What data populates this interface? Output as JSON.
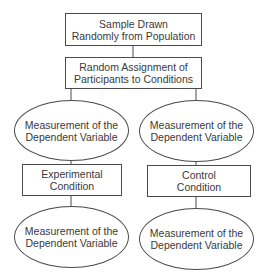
{
  "diagram": {
    "type": "flowchart",
    "nodes": {
      "sample": {
        "shape": "rectangle",
        "line1": "Sample Drawn",
        "line2": "Randomly from Population"
      },
      "assignment": {
        "shape": "rectangle",
        "line1": "Random Assignment of",
        "line2": "Participants to Conditions"
      },
      "pretest_left": {
        "shape": "ellipse",
        "line1": "Measurement of the",
        "line2": "Dependent Variable"
      },
      "pretest_right": {
        "shape": "ellipse",
        "line1": "Measurement of the",
        "line2": "Dependent Variable"
      },
      "experimental": {
        "shape": "rectangle",
        "line1": "Experimental",
        "line2": "Condition"
      },
      "control": {
        "shape": "rectangle",
        "line1": "Control",
        "line2": "Condition"
      },
      "posttest_left": {
        "shape": "ellipse",
        "line1": "Measurement of the",
        "line2": "Dependent Variable"
      },
      "posttest_right": {
        "shape": "ellipse",
        "line1": "Measurement of the",
        "line2": "Dependent Variable"
      }
    },
    "edges": [
      [
        "sample",
        "assignment"
      ],
      [
        "assignment",
        "pretest_left"
      ],
      [
        "assignment",
        "pretest_right"
      ],
      [
        "pretest_left",
        "experimental"
      ],
      [
        "pretest_right",
        "control"
      ],
      [
        "experimental",
        "posttest_left"
      ],
      [
        "control",
        "posttest_right"
      ]
    ],
    "colors": {
      "stroke": "#4a4a4a",
      "text": "#3a3a3a",
      "background": "#ffffff"
    }
  }
}
